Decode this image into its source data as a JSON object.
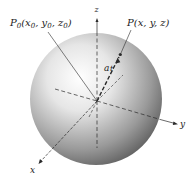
{
  "figure": {
    "labels": {
      "p0": "P",
      "p0_sub": "0",
      "p0_coords": "(x",
      "p0_coords_full": "P0(x0, y0, z0)",
      "p": "P(x, y, z)",
      "z_axis": "z",
      "y_axis": "y",
      "x_axis": "x",
      "ray": "a",
      "ray_tail": "t"
    },
    "colors": {
      "sphere_light": "#fbfbfb",
      "sphere_mid": "#bdbdbd",
      "sphere_dark": "#6a6a6a",
      "line": "#2a2a2a"
    }
  }
}
